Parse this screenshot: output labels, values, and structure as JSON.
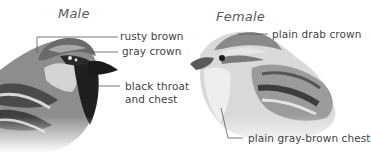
{
  "figure": {
    "male": {
      "title": "Male",
      "labels": {
        "rusty_brown": "rusty brown",
        "gray_crown": "gray crown",
        "black_throat_line1": "black throat",
        "black_throat_line2": "and chest"
      }
    },
    "female": {
      "title": "Female",
      "labels": {
        "plain_drab_crown": "plain drab crown",
        "plain_chest": "plain gray-brown chest"
      }
    }
  }
}
